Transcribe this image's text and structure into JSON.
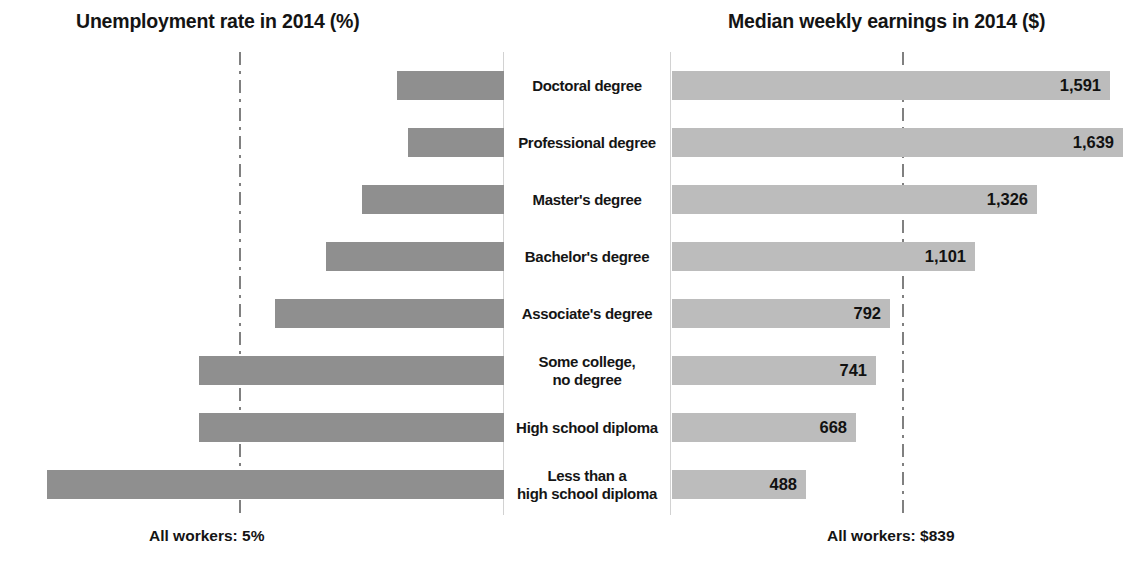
{
  "left_panel": {
    "title": "Unemployment rate in 2014 (%)",
    "footnote": "All workers: 5%"
  },
  "right_panel": {
    "title": "Median weekly earnings in 2014 ($)",
    "footnote": "All workers: $839"
  },
  "colors": {
    "bar_left": "#8f8f8f",
    "bar_right": "#bcbcbc",
    "reference_line": "#808080",
    "text": "#141414",
    "background": "#ffffff"
  },
  "rows": [
    {
      "label": "Doctoral degree",
      "unemployment": "2.1",
      "earnings": "1,591"
    },
    {
      "label": "Professional degree",
      "unemployment": "1.9",
      "earnings": "1,639"
    },
    {
      "label": "Master's degree",
      "unemployment": "2.8",
      "earnings": "1,326"
    },
    {
      "label": "Bachelor's degree",
      "unemployment": "3.5",
      "earnings": "1,101"
    },
    {
      "label": "Associate's degree",
      "unemployment": "4.5",
      "earnings": "792"
    },
    {
      "label": "Some college,\nno degree",
      "unemployment": "6.0",
      "earnings": "741"
    },
    {
      "label": "High school diploma",
      "unemployment": "6.0",
      "earnings": "668"
    },
    {
      "label": "Less than a\nhigh school diploma",
      "unemployment": "9.0",
      "earnings": "488"
    }
  ],
  "chart_data": {
    "type": "bar",
    "orientation": "horizontal",
    "layout": "butterfly / tornado, two opposed panels sharing centered category labels",
    "categories": [
      "Doctoral degree",
      "Professional degree",
      "Master's degree",
      "Bachelor's degree",
      "Associate's degree",
      "Some college, no degree",
      "High school diploma",
      "Less than a high school diploma"
    ],
    "series": [
      {
        "name": "Unemployment rate in 2014 (%)",
        "side": "left",
        "direction": "right-to-left (bars grow leftward from center)",
        "unit": "%",
        "values": [
          2.1,
          1.9,
          2.8,
          3.5,
          4.5,
          6.0,
          6.0,
          9.0
        ],
        "value_labels": [
          "2.1",
          "1.9",
          "2.8",
          "3.5",
          "4.5",
          "6.0",
          "6.0",
          "9.0"
        ],
        "label_position": "outside end of bar",
        "color": "#8f8f8f",
        "reference_line": {
          "label": "All workers: 5%",
          "value": 5.0
        }
      },
      {
        "name": "Median weekly earnings in 2014 ($)",
        "side": "right",
        "direction": "left-to-right (bars grow rightward from center)",
        "unit": "$",
        "values": [
          1591,
          1639,
          1326,
          1101,
          792,
          741,
          668,
          488
        ],
        "value_labels": [
          "1,591",
          "1,639",
          "1,326",
          "1,101",
          "792",
          "741",
          "668",
          "488"
        ],
        "label_position": "inside end of bar",
        "color": "#bcbcbc",
        "reference_line": {
          "label": "All workers: $839",
          "value": 839
        }
      }
    ],
    "xlabel": "",
    "ylabel": "",
    "grid": false,
    "legend": "none",
    "axis_ticks": "none",
    "annotations": [
      "All workers: 5%",
      "All workers: $839"
    ]
  }
}
